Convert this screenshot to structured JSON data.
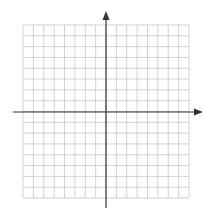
{
  "diagram": {
    "type": "coordinate-plane",
    "grid": {
      "columns": 16,
      "rows": 16,
      "left": 23,
      "top": 25,
      "right": 189,
      "bottom": 198,
      "line_color": "#c8c8c8"
    },
    "axes": {
      "color": "#333333",
      "x_axis": {
        "y": 112,
        "x_start": 13,
        "x_end": 203,
        "arrow": "right"
      },
      "y_axis": {
        "x": 106,
        "y_start": 11,
        "y_end": 208,
        "arrow": "up"
      },
      "origin_cell": {
        "col": 8,
        "row": 8
      }
    },
    "labels": []
  }
}
